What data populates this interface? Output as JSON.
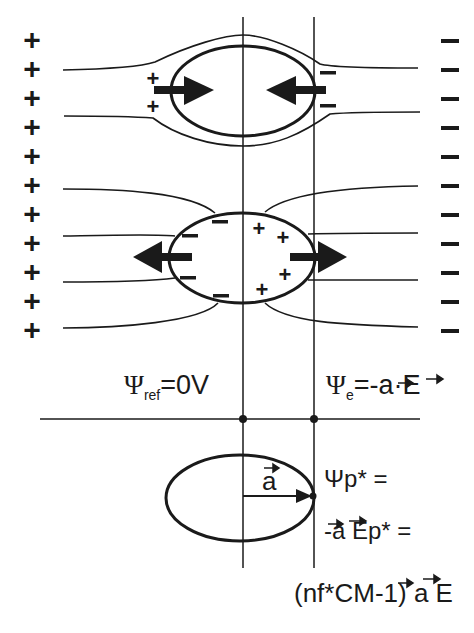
{
  "diagram": {
    "left_plate_sign": "+",
    "right_plate_sign": "−",
    "plate_charge_count": 11,
    "top_particle": {
      "description": "cell with inward DEP force arrows",
      "left_charges": [
        "+",
        "+"
      ],
      "right_charges": [
        "−",
        "−"
      ]
    },
    "middle_particle": {
      "description": "cell with outward DEP force arrows",
      "left_charges": [
        "−",
        "−",
        "−",
        "−"
      ],
      "right_charges": [
        "+",
        "+",
        "+",
        "+"
      ]
    },
    "labels": {
      "psi_ref_symbol": "Ψ",
      "psi_ref_sub": "ref",
      "psi_ref_value": "=0V",
      "psi_e_symbol": "Ψ",
      "psi_e_sub": "e",
      "psi_e_value": "=-a·E",
      "vector_a": "a",
      "psi_p_line1": "Ψp* =",
      "psi_p_line2": "-a Ep* =",
      "psi_p_line3": "(nf*CM-1) a E"
    },
    "colors": {
      "ink": "#1a1a1a",
      "background": "#ffffff"
    }
  }
}
